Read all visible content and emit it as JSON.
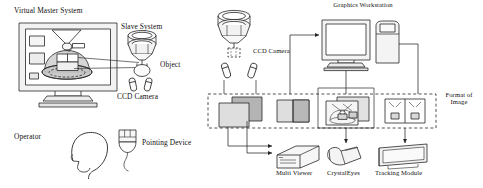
{
  "figure": {
    "type": "technical-diagram",
    "panels": [
      "virtual-master-system",
      "image-format-flow"
    ]
  },
  "left_panel": {
    "title": "Virtual Master System",
    "labels": {
      "slave_system": "Slave System",
      "object": "Object",
      "ccd_camera": "CCD Camera",
      "operator": "Operator",
      "pointing_device": "Pointing Device"
    },
    "components": [
      {
        "name": "display-monitor",
        "label": "Virtual Master System"
      },
      {
        "name": "slave-manipulator",
        "label": "Slave System"
      },
      {
        "name": "grasped-object",
        "label": "Object"
      },
      {
        "name": "ccd-camera-pair",
        "label": "CCD Camera"
      },
      {
        "name": "operator-head",
        "label": "Operator"
      },
      {
        "name": "pointing-device",
        "label": "Pointing Device"
      }
    ]
  },
  "right_panel": {
    "labels": {
      "graphics_workstation": "Graphics Workstation",
      "ccd_camera": "CCD Camera",
      "format_of_image": "Format of Image",
      "multi_viewer": "Multi Viewer",
      "crystal_eyes": "CrystalEyes",
      "tracking_module": "Tracking Module"
    },
    "image_formats": [
      {
        "name": "overlapping-frames",
        "style": "two overlapping frames"
      },
      {
        "name": "side-by-side-split",
        "style": "vertical split pair"
      },
      {
        "name": "overlaid-scene-views",
        "style": "two overlapping scene views"
      },
      {
        "name": "quad-split",
        "style": "two-up framed views"
      }
    ],
    "devices": [
      {
        "name": "multi-viewer",
        "label": "Multi Viewer"
      },
      {
        "name": "crystal-eyes",
        "label": "CrystalEyes"
      },
      {
        "name": "tracking-module",
        "label": "Tracking Module"
      }
    ]
  },
  "colors": {
    "line": "#262626",
    "fill_light": "#e6e6e6",
    "fill_mid": "#cfcfcf",
    "fill_dark": "#b4b4b4",
    "paper": "#ffffff"
  }
}
